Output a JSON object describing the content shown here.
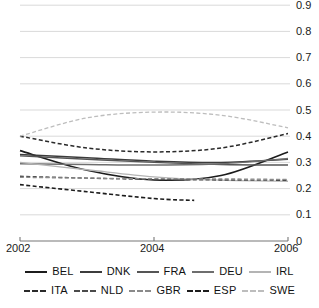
{
  "chart_data": {
    "type": "line",
    "title": "",
    "xlabel": "",
    "ylabel": "",
    "xlim": [
      2002,
      2006
    ],
    "ylim": [
      0,
      0.9
    ],
    "grid": true,
    "legend_position": "bottom",
    "x": [
      2002,
      2003,
      2004,
      2005,
      2006
    ],
    "xticks": [
      "2002",
      "2004",
      "2006"
    ],
    "xtick_values": [
      2002,
      2004,
      2006
    ],
    "yticks": [
      "0",
      "0.1",
      "0.2",
      "0.3",
      "0.4",
      "0.5",
      "0.6",
      "0.7",
      "0.8",
      "0.9"
    ],
    "ytick_values": [
      0,
      0.1,
      0.2,
      0.3,
      0.4,
      0.5,
      0.6,
      0.7,
      0.8,
      0.9
    ],
    "series": [
      {
        "name": "BEL",
        "style": "solid",
        "color": "#1c1c1c",
        "width": 1.6,
        "x": [
          2002,
          2003,
          2004,
          2005,
          2006
        ],
        "values": [
          0.345,
          0.27,
          0.233,
          0.25,
          0.34
        ]
      },
      {
        "name": "DNK",
        "style": "solid",
        "color": "#3c3c3c",
        "width": 1.4,
        "x": [
          2002,
          2003,
          2004,
          2005,
          2006
        ],
        "values": [
          0.33,
          0.318,
          0.305,
          0.3,
          0.312
        ]
      },
      {
        "name": "FRA",
        "style": "solid",
        "color": "#555555",
        "width": 1.4,
        "x": [
          2002,
          2003,
          2004,
          2005,
          2006
        ],
        "values": [
          0.325,
          0.312,
          0.3,
          0.292,
          0.29
        ]
      },
      {
        "name": "DEU",
        "style": "solid",
        "color": "#6e6e6e",
        "width": 1.4,
        "x": [
          2002,
          2003,
          2004,
          2005,
          2006
        ],
        "values": [
          0.295,
          0.292,
          0.29,
          0.295,
          0.315
        ]
      },
      {
        "name": "IRL",
        "style": "solid",
        "color": "#b4b4b4",
        "width": 1.3,
        "x": [
          2002,
          2003,
          2004,
          2005,
          2006
        ],
        "values": [
          0.3,
          0.272,
          0.245,
          0.232,
          0.228
        ]
      },
      {
        "name": "ITA",
        "style": "dashed",
        "color": "#2a2a2a",
        "width": 1.5,
        "x": [
          2002,
          2003,
          2004,
          2005,
          2006
        ],
        "values": [
          0.4,
          0.355,
          0.34,
          0.355,
          0.41
        ]
      },
      {
        "name": "NLD",
        "style": "dashed",
        "color": "#4a4a4a",
        "width": 1.4,
        "x": [
          2002,
          2003,
          2004,
          2005,
          2006
        ],
        "values": [
          0.247,
          0.24,
          0.235,
          0.233,
          0.232
        ]
      },
      {
        "name": "GBR",
        "style": "dashed",
        "color": "#8a8a8a",
        "width": 1.3,
        "x": [
          2002,
          2003,
          2004,
          2005,
          2006
        ],
        "values": [
          0.243,
          0.24,
          0.238,
          0.237,
          0.235
        ]
      },
      {
        "name": "ESP",
        "style": "dashed",
        "color": "#1c1c1c",
        "width": 1.6,
        "x": [
          2002,
          2003,
          2004,
          2004.6
        ],
        "values": [
          0.215,
          0.188,
          0.162,
          0.155
        ]
      },
      {
        "name": "SWE",
        "style": "dashed",
        "color": "#bdbdbd",
        "width": 1.3,
        "x": [
          2002,
          2003,
          2004,
          2005,
          2006
        ],
        "values": [
          0.4,
          0.47,
          0.492,
          0.48,
          0.432
        ]
      }
    ]
  },
  "legend": {
    "rows": [
      [
        {
          "label": "BEL",
          "style": "solid",
          "color": "#1c1c1c"
        },
        {
          "label": "DNK",
          "style": "solid",
          "color": "#3c3c3c"
        },
        {
          "label": "FRA",
          "style": "solid",
          "color": "#555555"
        },
        {
          "label": "DEU",
          "style": "solid",
          "color": "#6e6e6e"
        },
        {
          "label": "IRL",
          "style": "solid",
          "color": "#b4b4b4"
        }
      ],
      [
        {
          "label": "ITA",
          "style": "dashed",
          "color": "#2a2a2a"
        },
        {
          "label": "NLD",
          "style": "dashed",
          "color": "#4a4a4a"
        },
        {
          "label": "GBR",
          "style": "dashed",
          "color": "#8a8a8a"
        },
        {
          "label": "ESP",
          "style": "dashed",
          "color": "#1c1c1c"
        },
        {
          "label": "SWE",
          "style": "dashed",
          "color": "#bdbdbd"
        }
      ]
    ]
  },
  "axis": {
    "grid_color": "#cfcfcf",
    "axis_color": "#777777",
    "tick_text_color": "#1a1a1a"
  }
}
